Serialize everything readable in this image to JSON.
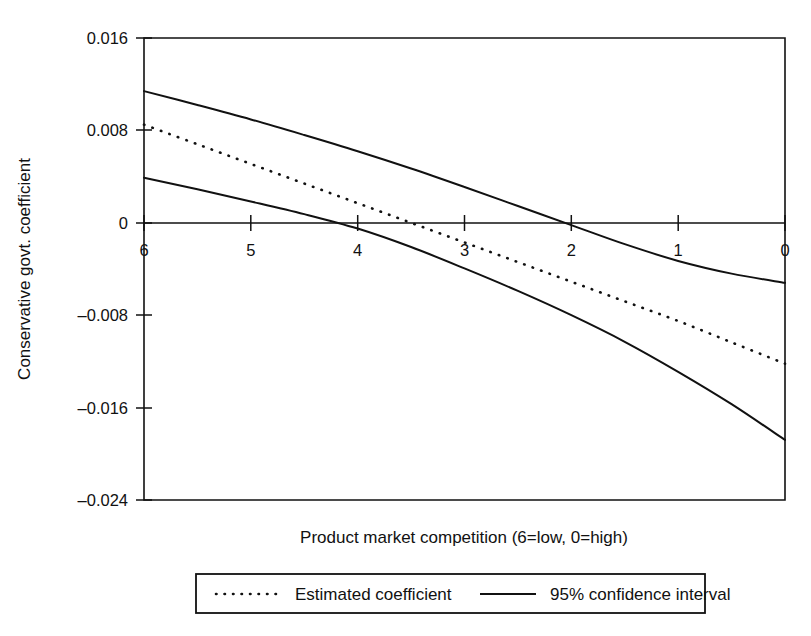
{
  "chart_data": {
    "type": "line",
    "title": "",
    "xlabel": "Product market competition (6=low, 0=high)",
    "ylabel": "Conservative govt. coefficient",
    "xlim": [
      6,
      0
    ],
    "ylim": [
      -0.024,
      0.016
    ],
    "x_ticks": [
      "6",
      "5",
      "4",
      "3",
      "2",
      "1",
      "0"
    ],
    "x_tick_values": [
      6,
      5,
      4,
      3,
      2,
      1,
      0
    ],
    "y_ticks": [
      "0.016",
      "0.008",
      "0",
      "–0.008",
      "–0.016",
      "–0.024"
    ],
    "y_tick_values": [
      0.016,
      0.008,
      0,
      -0.008,
      -0.016,
      -0.024
    ],
    "grid": false,
    "axis_direction_note": "x axis decreases left to right (6 at left, 0 at right)",
    "legend_position": "below-plot",
    "x": [
      6,
      5.5,
      5,
      4.5,
      4,
      3.5,
      3,
      2.5,
      2,
      1.5,
      1,
      0.5,
      0
    ],
    "series": [
      {
        "name": "Estimated coefficient",
        "style": "dotted",
        "color": "#111111",
        "values": [
          0.0085,
          0.0068,
          0.0051,
          0.0034,
          0.0017,
          0.0,
          -0.0017,
          -0.0034,
          -0.0051,
          -0.0068,
          -0.0085,
          -0.01035,
          -0.0122
        ]
      },
      {
        "name": "95% confidence interval upper",
        "style": "solid",
        "color": "#111111",
        "values": [
          0.0114,
          0.0102,
          0.00895,
          0.0076,
          0.0062,
          0.0047,
          0.0031,
          0.00145,
          -0.0002,
          -0.00185,
          -0.0033,
          -0.0044,
          -0.0052
        ]
      },
      {
        "name": "95% confidence interval lower",
        "style": "solid",
        "color": "#111111",
        "values": [
          0.0039,
          0.0029,
          0.00185,
          0.00075,
          -0.0005,
          -0.0021,
          -0.00395,
          -0.0059,
          -0.008,
          -0.0103,
          -0.0129,
          -0.0157,
          -0.0188
        ]
      }
    ],
    "zero_crossings": {
      "estimated_coefficient": 3.5,
      "upper_confidence_interval": 1.9,
      "lower_confidence_interval": 4.35
    }
  },
  "legend": {
    "entries": [
      {
        "label": "Estimated coefficient",
        "style": "dotted"
      },
      {
        "label": "95% confidence interval",
        "style": "solid"
      }
    ]
  }
}
